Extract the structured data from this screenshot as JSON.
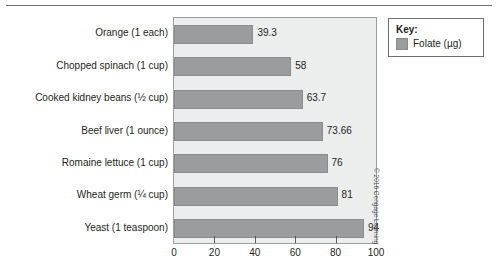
{
  "chart_data": {
    "type": "bar",
    "orientation": "horizontal",
    "title": "",
    "xlabel": "",
    "ylabel": "",
    "xlim": [
      0,
      100
    ],
    "xticks": [
      0,
      20,
      40,
      60,
      80,
      100
    ],
    "grid": false,
    "categories": [
      "Orange (1 each)",
      "Chopped spinach (1 cup)",
      "Cooked kidney beans (½ cup)",
      "Beef liver (1 ounce)",
      "Romaine lettuce (1 cup)",
      "Wheat germ (¼ cup)",
      "Yeast (1 teaspoon)"
    ],
    "values": [
      39.3,
      58,
      63.7,
      73.66,
      76,
      81,
      94
    ],
    "value_labels": [
      "39.3",
      "58",
      "63.7",
      "73.66",
      "76",
      "81",
      "94"
    ],
    "series": [
      {
        "name": "Folate (µg)",
        "values": [
          39.3,
          58,
          63.7,
          73.66,
          76,
          81,
          94
        ]
      }
    ],
    "legend_position": "top-right",
    "colors": {
      "bar": "#9a9c9e",
      "bar_border": "#8a8c8e",
      "plot_background": "#eceded",
      "plot_border": "#9b9d9f",
      "text": "#231f20"
    }
  },
  "legend": {
    "title": "Key:",
    "entries": [
      {
        "label": "Folate (µg)",
        "color": "#9a9c9e"
      }
    ]
  },
  "credit": {
    "text": "© 2016 Cengage Learning"
  }
}
